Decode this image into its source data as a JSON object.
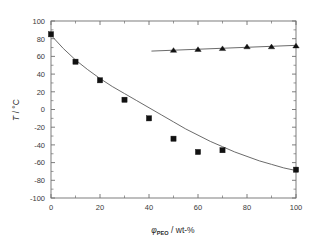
{
  "chart_data": {
    "type": "scatter",
    "title": "",
    "xlabel": "φPEO / wt-%",
    "xlabel_symbol": "φ",
    "xlabel_subscript": "PEO",
    "xlabel_rest": " / wt-%",
    "ylabel": "T / °C",
    "ylabel_symbol": "T",
    "ylabel_rest": " / °C",
    "xlim": [
      0,
      100
    ],
    "ylim": [
      -100,
      100
    ],
    "xticks": [
      0,
      20,
      40,
      60,
      80,
      100
    ],
    "xtick_labels": [
      "0",
      "20",
      "40",
      "60",
      "80",
      "100"
    ],
    "xminor_step": 10,
    "yticks": [
      -100,
      -80,
      -60,
      -40,
      -20,
      0,
      20,
      40,
      60,
      80,
      100
    ],
    "ytick_labels": [
      "-100",
      "-80",
      "-60",
      "-40",
      "-20",
      "0",
      "20",
      "40",
      "60",
      "80",
      "100"
    ],
    "yminor_step": 10,
    "grid": false,
    "legend": "none",
    "series": [
      {
        "name": "squares",
        "marker": "square",
        "color": "#111111",
        "x": [
          0,
          10,
          20,
          30,
          40,
          50,
          60,
          70,
          100
        ],
        "y": [
          85,
          54,
          33,
          11,
          -10,
          -33,
          -48,
          -46,
          -68
        ]
      },
      {
        "name": "triangles",
        "marker": "triangle",
        "color": "#111111",
        "x": [
          50,
          60,
          70,
          80,
          90,
          100
        ],
        "y": [
          67,
          68,
          69,
          71,
          71,
          72
        ]
      }
    ],
    "fit_curves": [
      {
        "name": "square-fit",
        "color": "#6b6b6b",
        "x": [
          0,
          5,
          10,
          15,
          20,
          25,
          30,
          35,
          40,
          45,
          50,
          55,
          60,
          65,
          70,
          75,
          80,
          85,
          90,
          95,
          100
        ],
        "y": [
          84,
          69,
          56,
          45,
          35,
          26,
          18,
          10,
          2,
          -6,
          -14,
          -22,
          -29,
          -36,
          -42,
          -48,
          -53,
          -58,
          -62,
          -66,
          -69
        ]
      },
      {
        "name": "triangle-fit",
        "color": "#6b6b6b",
        "x": [
          41,
          100
        ],
        "y": [
          66,
          72.5
        ]
      }
    ]
  },
  "figure": {
    "background": "#ffffff",
    "axis_color": "#6f6f6f",
    "marker_color": "#111111",
    "curve_color": "#6b6b6b"
  }
}
